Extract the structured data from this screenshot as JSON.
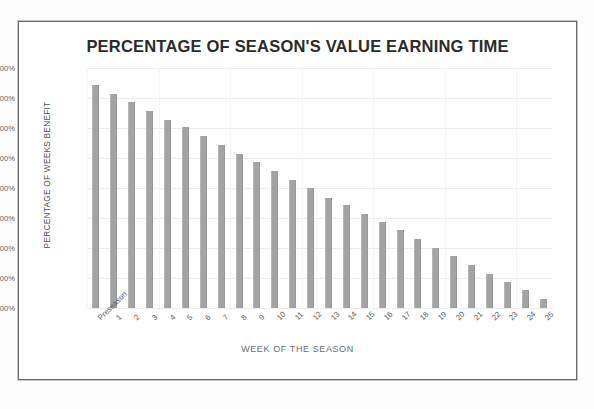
{
  "chart_data": {
    "type": "bar",
    "title": "PERCENTAGE OF SEASON'S VALUE EARNING TIME",
    "xlabel": "WEEK OF THE SEASON",
    "ylabel": "PERCENTAGE OF WEEKS BENEFIT",
    "ylim": [
      0,
      8
    ],
    "ytick_labels": [
      "8.00%",
      "7.00%",
      "6.00%",
      "5.00%",
      "4.00%",
      "3.00%",
      "2.00%",
      "1.00%",
      "0.00%"
    ],
    "ytick_values": [
      8,
      7,
      6,
      5,
      4,
      3,
      2,
      1,
      0
    ],
    "grid": true,
    "legend": "none",
    "bar_color": "#a3a3a3",
    "categories": [
      "Preseason",
      "1",
      "2",
      "3",
      "4",
      "5",
      "6",
      "7",
      "8",
      "9",
      "10",
      "11",
      "12",
      "13",
      "14",
      "15",
      "16",
      "17",
      "18",
      "19",
      "20",
      "21",
      "22",
      "23",
      "24",
      "25"
    ],
    "values": [
      7.43,
      7.15,
      6.86,
      6.58,
      6.28,
      6.02,
      5.72,
      5.42,
      5.15,
      4.86,
      4.56,
      4.28,
      4.0,
      3.68,
      3.42,
      3.13,
      2.86,
      2.6,
      2.3,
      2.01,
      1.75,
      1.45,
      1.15,
      0.88,
      0.6,
      0.3
    ]
  },
  "page": {
    "background": "#fdfdfd",
    "frame_color": "#6b6b6d"
  }
}
